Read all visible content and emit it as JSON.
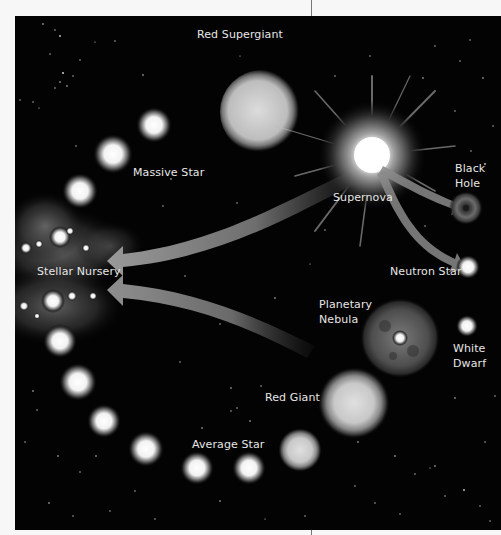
{
  "diagram": {
    "colors": {
      "background": "#030303",
      "page": "#f7f7f7",
      "label": "#e6e6e6",
      "arrow": "#8a8a8a",
      "star": "#ffffff"
    },
    "labels": {
      "red_supergiant": "Red Supergiant",
      "massive_star": "Massive Star",
      "supernova": "Supernova",
      "black_hole_1": "Black",
      "black_hole_2": "Hole",
      "stellar_nursery": "Stellar Nursery",
      "neutron_star": "Neutron Star",
      "planetary_nebula_1": "Planetary",
      "planetary_nebula_2": "Nebula",
      "white_dwarf_1": "White",
      "white_dwarf_2": "Dwarf",
      "red_giant": "Red Giant",
      "average_star": "Average Star"
    },
    "nodes": [
      {
        "id": "stellar_nursery",
        "label": "Stellar Nursery"
      },
      {
        "id": "massive_star",
        "label": "Massive Star"
      },
      {
        "id": "red_supergiant",
        "label": "Red Supergiant"
      },
      {
        "id": "supernova",
        "label": "Supernova"
      },
      {
        "id": "black_hole",
        "label": "Black Hole"
      },
      {
        "id": "neutron_star",
        "label": "Neutron Star"
      },
      {
        "id": "average_star",
        "label": "Average Star"
      },
      {
        "id": "red_giant",
        "label": "Red Giant"
      },
      {
        "id": "planetary_nebula",
        "label": "Planetary Nebula"
      },
      {
        "id": "white_dwarf",
        "label": "White Dwarf"
      }
    ],
    "edges": [
      {
        "from": "stellar_nursery",
        "to": "massive_star"
      },
      {
        "from": "massive_star",
        "to": "red_supergiant"
      },
      {
        "from": "red_supergiant",
        "to": "supernova"
      },
      {
        "from": "supernova",
        "to": "black_hole"
      },
      {
        "from": "supernova",
        "to": "neutron_star"
      },
      {
        "from": "supernova",
        "to": "stellar_nursery"
      },
      {
        "from": "stellar_nursery",
        "to": "average_star"
      },
      {
        "from": "average_star",
        "to": "red_giant"
      },
      {
        "from": "red_giant",
        "to": "planetary_nebula"
      },
      {
        "from": "planetary_nebula",
        "to": "white_dwarf"
      },
      {
        "from": "planetary_nebula",
        "to": "stellar_nursery"
      }
    ]
  }
}
